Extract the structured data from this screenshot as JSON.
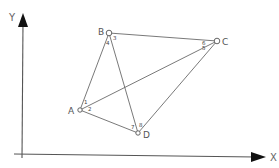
{
  "axes": {
    "x_label": "X",
    "y_label": "Y"
  },
  "points": {
    "A": {
      "label": "A",
      "x": 80,
      "y": 110
    },
    "B": {
      "label": "B",
      "x": 109,
      "y": 33
    },
    "C": {
      "label": "C",
      "x": 217,
      "y": 41
    },
    "D": {
      "label": "D",
      "x": 138,
      "y": 133
    }
  },
  "edges": [
    [
      "A",
      "B"
    ],
    [
      "B",
      "C"
    ],
    [
      "B",
      "D"
    ],
    [
      "A",
      "C"
    ],
    [
      "A",
      "D"
    ],
    [
      "C",
      "D"
    ]
  ],
  "angle_labels": {
    "a1": "1",
    "a2": "2",
    "a3": "3",
    "a4": "4",
    "a5": "5",
    "a6": "6",
    "a7": "7",
    "a8": "8"
  },
  "colors": {
    "line": "#6a6a6a",
    "axis": "#555555",
    "background": "#ffffff"
  }
}
